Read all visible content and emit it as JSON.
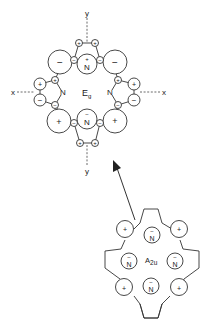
{
  "figure": {
    "top_diagram": {
      "symmetry_label": "E",
      "symmetry_subscript": "g",
      "axis_labels": {
        "x_left": "x",
        "x_right": "x",
        "y_top": "y",
        "y_bottom": "y"
      },
      "nitrogen_top": {
        "label": "N",
        "charge": "+"
      },
      "nitrogen_bottom": {
        "label": "N",
        "charge": "−"
      },
      "nitrogen_left": {
        "label": "N"
      },
      "nitrogen_right": {
        "label": "N"
      },
      "meso_top_left": "−",
      "meso_top_right": "−",
      "meso_bottom_left": "+",
      "meso_bottom_right": "+",
      "alpha_top": [
        "−",
        "−"
      ],
      "beta_top": [
        "+",
        "+"
      ],
      "alpha_bottom": [
        "−",
        "−"
      ],
      "beta_bottom": [
        "+",
        "+"
      ],
      "alpha_left": [
        "+",
        "−"
      ],
      "beta_left": [
        "+",
        "−"
      ],
      "alpha_right": [
        "+",
        "−"
      ],
      "beta_right": [
        "+",
        "−"
      ]
    },
    "bottom_diagram": {
      "symmetry_label": "A",
      "symmetry_subscript": "2u",
      "nitrogen_label": "N",
      "nitrogen_charge": "−",
      "meso_charges": [
        "+",
        "+",
        "+",
        "+"
      ]
    },
    "arrow": "transition from A2u to Eg"
  }
}
